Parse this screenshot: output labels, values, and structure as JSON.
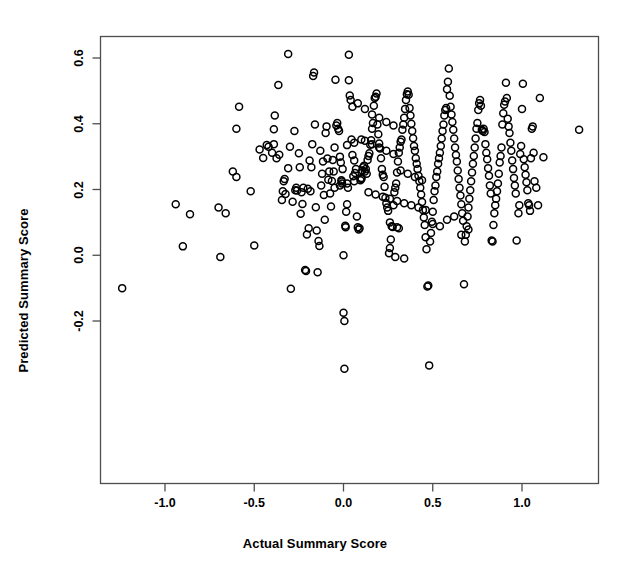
{
  "figure": {
    "type": "scatter-plot",
    "width": 630,
    "height": 581,
    "background_color": "#ffffff",
    "frame_color": "#4d4d4d",
    "point_color": "#000000",
    "point_fill": "none"
  },
  "axes": {
    "x_title": "Actual Summary Score",
    "y_title": "Predicted Summary Score",
    "x_ticks": [
      "-1.0",
      "-0.5",
      "0.0",
      "0.5",
      "1.0"
    ],
    "y_ticks": [
      "-0.2",
      "0.0",
      "0.2",
      "0.4",
      "0.6"
    ]
  },
  "chart_data": {
    "type": "scatter",
    "title": "",
    "xlabel": "Actual Summary Score",
    "ylabel": "Predicted Summary Score",
    "xticks": [
      -1.0,
      -0.5,
      0.0,
      0.5,
      1.0
    ],
    "yticks": [
      -0.2,
      0.0,
      0.2,
      0.4,
      0.6
    ],
    "xlim": [
      -1.37,
      1.44
    ],
    "ylim": [
      -0.375,
      0.675
    ],
    "grid": false,
    "legend": null,
    "marker": "open-circle",
    "marker_size": 7,
    "n_points": 341,
    "points": [
      [
        -1.24,
        -0.1
      ],
      [
        -0.94,
        0.155
      ],
      [
        -0.9,
        0.027
      ],
      [
        -0.86,
        0.125
      ],
      [
        -0.7,
        0.145
      ],
      [
        -0.69,
        -0.005
      ],
      [
        -0.66,
        0.128
      ],
      [
        -0.62,
        0.255
      ],
      [
        -0.6,
        0.238
      ],
      [
        -0.585,
        0.452
      ],
      [
        -0.6,
        0.385
      ],
      [
        -0.52,
        0.195
      ],
      [
        -0.5,
        0.03
      ],
      [
        -0.47,
        0.322
      ],
      [
        -0.45,
        0.296
      ],
      [
        -0.43,
        0.335
      ],
      [
        -0.42,
        0.33
      ],
      [
        -0.4,
        0.312
      ],
      [
        -0.39,
        0.338
      ],
      [
        -0.385,
        0.425
      ],
      [
        -0.39,
        0.383
      ],
      [
        -0.375,
        0.295
      ],
      [
        -0.365,
        0.518
      ],
      [
        -0.36,
        0.306
      ],
      [
        -0.345,
        0.168
      ],
      [
        -0.34,
        0.195
      ],
      [
        -0.335,
        0.225
      ],
      [
        -0.33,
        0.232
      ],
      [
        -0.325,
        0.186
      ],
      [
        -0.31,
        0.612
      ],
      [
        -0.31,
        0.265
      ],
      [
        -0.3,
        0.33
      ],
      [
        -0.295,
        -0.102
      ],
      [
        -0.285,
        0.163
      ],
      [
        -0.275,
        0.378
      ],
      [
        -0.27,
        0.198
      ],
      [
        -0.265,
        0.205
      ],
      [
        -0.26,
        0.197
      ],
      [
        -0.25,
        0.31
      ],
      [
        -0.245,
        0.268
      ],
      [
        -0.24,
        0.126
      ],
      [
        -0.235,
        0.192
      ],
      [
        -0.23,
        0.156
      ],
      [
        -0.225,
        0.205
      ],
      [
        -0.215,
        -0.045
      ],
      [
        -0.21,
        -0.048
      ],
      [
        -0.205,
        0.063
      ],
      [
        -0.2,
        0.202
      ],
      [
        -0.195,
        0.082
      ],
      [
        -0.19,
        0.288
      ],
      [
        -0.185,
        0.195
      ],
      [
        -0.18,
        0.268
      ],
      [
        -0.175,
        0.338
      ],
      [
        -0.17,
        0.545
      ],
      [
        -0.165,
        0.556
      ],
      [
        -0.16,
        0.398
      ],
      [
        -0.155,
        0.146
      ],
      [
        -0.15,
        0.075
      ],
      [
        -0.145,
        -0.052
      ],
      [
        -0.14,
        0.043
      ],
      [
        -0.135,
        0.028
      ],
      [
        -0.13,
        0.318
      ],
      [
        -0.125,
        0.212
      ],
      [
        -0.12,
        0.248
      ],
      [
        -0.115,
        0.285
      ],
      [
        -0.11,
        0.183
      ],
      [
        -0.105,
        0.108
      ],
      [
        -0.1,
        0.372
      ],
      [
        -0.095,
        0.392
      ],
      [
        -0.09,
        0.294
      ],
      [
        -0.085,
        0.23
      ],
      [
        -0.08,
        0.255
      ],
      [
        -0.075,
        0.188
      ],
      [
        -0.07,
        0.148
      ],
      [
        -0.065,
        0.226
      ],
      [
        -0.06,
        0.29
      ],
      [
        -0.055,
        0.255
      ],
      [
        -0.05,
        0.328
      ],
      [
        -0.045,
        0.534
      ],
      [
        -0.04,
        0.395
      ],
      [
        -0.035,
        0.402
      ],
      [
        -0.03,
        0.385
      ],
      [
        -0.025,
        0.378
      ],
      [
        -0.02,
        0.3
      ],
      [
        -0.015,
        0.282
      ],
      [
        -0.012,
        0.228
      ],
      [
        -0.01,
        0.224
      ],
      [
        -0.008,
        0.218
      ],
      [
        -0.005,
        0.262
      ],
      [
        0.0,
        0.0
      ],
      [
        0.0,
        -0.175
      ],
      [
        0.005,
        -0.2
      ],
      [
        0.005,
        -0.345
      ],
      [
        0.01,
        0.09
      ],
      [
        0.012,
        0.085
      ],
      [
        0.015,
        0.132
      ],
      [
        0.02,
        0.155
      ],
      [
        0.025,
        0.205
      ],
      [
        0.03,
        0.61
      ],
      [
        0.03,
        0.532
      ],
      [
        0.035,
        0.486
      ],
      [
        0.04,
        0.472
      ],
      [
        0.045,
        0.352
      ],
      [
        0.05,
        0.305
      ],
      [
        0.055,
        0.24
      ],
      [
        0.06,
        0.288
      ],
      [
        0.065,
        0.25
      ],
      [
        0.07,
        0.262
      ],
      [
        0.075,
        0.118
      ],
      [
        0.08,
        0.085
      ],
      [
        0.085,
        0.078
      ],
      [
        0.09,
        0.082
      ],
      [
        0.095,
        0.228
      ],
      [
        0.1,
        0.235
      ],
      [
        0.105,
        0.258
      ],
      [
        0.11,
        0.268
      ],
      [
        0.115,
        0.272
      ],
      [
        0.12,
        0.255
      ],
      [
        0.125,
        0.262
      ],
      [
        0.13,
        0.248
      ],
      [
        0.135,
        0.29
      ],
      [
        0.14,
        0.302
      ],
      [
        0.145,
        0.31
      ],
      [
        0.15,
        0.336
      ],
      [
        0.155,
        0.35
      ],
      [
        0.16,
        0.385
      ],
      [
        0.165,
        0.402
      ],
      [
        0.17,
        0.455
      ],
      [
        0.175,
        0.478
      ],
      [
        0.18,
        0.482
      ],
      [
        0.185,
        0.492
      ],
      [
        0.19,
        0.398
      ],
      [
        0.195,
        0.368
      ],
      [
        0.2,
        0.34
      ],
      [
        0.205,
        0.325
      ],
      [
        0.21,
        0.295
      ],
      [
        0.215,
        0.262
      ],
      [
        0.22,
        0.245
      ],
      [
        0.225,
        0.238
      ],
      [
        0.23,
        0.208
      ],
      [
        0.235,
        0.175
      ],
      [
        0.24,
        0.158
      ],
      [
        0.245,
        0.145
      ],
      [
        0.25,
        0.135
      ],
      [
        0.255,
        0.006
      ],
      [
        0.26,
        0.022
      ],
      [
        0.265,
        0.048
      ],
      [
        0.27,
        0.088
      ],
      [
        0.275,
        0.086
      ],
      [
        0.28,
        0.152
      ],
      [
        0.285,
        0.192
      ],
      [
        0.29,
        0.205
      ],
      [
        0.295,
        0.218
      ],
      [
        0.3,
        0.252
      ],
      [
        0.305,
        0.285
      ],
      [
        0.31,
        0.312
      ],
      [
        0.315,
        0.328
      ],
      [
        0.32,
        0.345
      ],
      [
        0.325,
        0.352
      ],
      [
        0.33,
        0.382
      ],
      [
        0.335,
        0.398
      ],
      [
        0.34,
        0.418
      ],
      [
        0.345,
        0.445
      ],
      [
        0.35,
        0.472
      ],
      [
        0.355,
        0.49
      ],
      [
        0.36,
        0.498
      ],
      [
        0.365,
        0.488
      ],
      [
        0.37,
        0.448
      ],
      [
        0.375,
        0.425
      ],
      [
        0.38,
        0.4
      ],
      [
        0.385,
        0.378
      ],
      [
        0.39,
        0.356
      ],
      [
        0.395,
        0.332
      ],
      [
        0.4,
        0.318
      ],
      [
        0.405,
        0.295
      ],
      [
        0.41,
        0.278
      ],
      [
        0.415,
        0.262
      ],
      [
        0.42,
        0.242
      ],
      [
        0.425,
        0.225
      ],
      [
        0.43,
        0.205
      ],
      [
        0.435,
        0.185
      ],
      [
        0.44,
        0.162
      ],
      [
        0.445,
        0.138
      ],
      [
        0.45,
        0.115
      ],
      [
        0.455,
        0.092
      ],
      [
        0.46,
        0.055
      ],
      [
        0.465,
        0.018
      ],
      [
        0.47,
        -0.095
      ],
      [
        0.475,
        -0.092
      ],
      [
        0.48,
        -0.335
      ],
      [
        0.485,
        0.042
      ],
      [
        0.49,
        0.068
      ],
      [
        0.495,
        0.102
      ],
      [
        0.5,
        0.132
      ],
      [
        0.505,
        0.168
      ],
      [
        0.51,
        0.195
      ],
      [
        0.515,
        0.212
      ],
      [
        0.52,
        0.238
      ],
      [
        0.525,
        0.255
      ],
      [
        0.53,
        0.278
      ],
      [
        0.535,
        0.295
      ],
      [
        0.54,
        0.312
      ],
      [
        0.545,
        0.332
      ],
      [
        0.55,
        0.355
      ],
      [
        0.555,
        0.378
      ],
      [
        0.56,
        0.398
      ],
      [
        0.565,
        0.425
      ],
      [
        0.57,
        0.442
      ],
      [
        0.575,
        0.448
      ],
      [
        0.58,
        0.505
      ],
      [
        0.585,
        0.528
      ],
      [
        0.59,
        0.568
      ],
      [
        0.595,
        0.485
      ],
      [
        0.6,
        0.452
      ],
      [
        0.605,
        0.428
      ],
      [
        0.61,
        0.405
      ],
      [
        0.615,
        0.382
      ],
      [
        0.62,
        0.355
      ],
      [
        0.625,
        0.328
      ],
      [
        0.63,
        0.305
      ],
      [
        0.635,
        0.285
      ],
      [
        0.64,
        0.258
      ],
      [
        0.645,
        0.232
      ],
      [
        0.65,
        0.205
      ],
      [
        0.655,
        0.182
      ],
      [
        0.66,
        0.155
      ],
      [
        0.665,
        0.128
      ],
      [
        0.67,
        0.105
      ],
      [
        0.675,
        -0.088
      ],
      [
        0.68,
        0.042
      ],
      [
        0.685,
        0.062
      ],
      [
        0.69,
        0.088
      ],
      [
        0.695,
        0.118
      ],
      [
        0.7,
        0.145
      ],
      [
        0.705,
        0.172
      ],
      [
        0.71,
        0.198
      ],
      [
        0.715,
        0.225
      ],
      [
        0.72,
        0.252
      ],
      [
        0.725,
        0.278
      ],
      [
        0.73,
        0.302
      ],
      [
        0.735,
        0.328
      ],
      [
        0.74,
        0.355
      ],
      [
        0.745,
        0.385
      ],
      [
        0.75,
        0.402
      ],
      [
        0.755,
        0.442
      ],
      [
        0.76,
        0.462
      ],
      [
        0.765,
        0.472
      ],
      [
        0.77,
        0.455
      ],
      [
        0.775,
        0.382
      ],
      [
        0.78,
        0.378
      ],
      [
        0.785,
        0.385
      ],
      [
        0.79,
        0.375
      ],
      [
        0.795,
        0.338
      ],
      [
        0.8,
        0.312
      ],
      [
        0.805,
        0.292
      ],
      [
        0.81,
        0.265
      ],
      [
        0.815,
        0.242
      ],
      [
        0.82,
        0.212
      ],
      [
        0.825,
        0.188
      ],
      [
        0.83,
        0.045
      ],
      [
        0.835,
        0.042
      ],
      [
        0.84,
        0.092
      ],
      [
        0.845,
        0.128
      ],
      [
        0.85,
        0.152
      ],
      [
        0.855,
        0.172
      ],
      [
        0.86,
        0.195
      ],
      [
        0.865,
        0.218
      ],
      [
        0.87,
        0.248
      ],
      [
        0.875,
        0.282
      ],
      [
        0.88,
        0.302
      ],
      [
        0.885,
        0.328
      ],
      [
        0.89,
        0.398
      ],
      [
        0.895,
        0.432
      ],
      [
        0.9,
        0.458
      ],
      [
        0.905,
        0.468
      ],
      [
        0.91,
        0.525
      ],
      [
        0.915,
        0.478
      ],
      [
        0.92,
        0.415
      ],
      [
        0.925,
        0.392
      ],
      [
        0.93,
        0.372
      ],
      [
        0.935,
        0.342
      ],
      [
        0.94,
        0.318
      ],
      [
        0.945,
        0.288
      ],
      [
        0.95,
        0.262
      ],
      [
        0.955,
        0.235
      ],
      [
        0.96,
        0.212
      ],
      [
        0.965,
        0.188
      ],
      [
        0.97,
        0.045
      ],
      [
        0.98,
        0.128
      ],
      [
        0.985,
        0.152
      ],
      [
        0.99,
        0.308
      ],
      [
        0.995,
        0.332
      ],
      [
        1.0,
        0.445
      ],
      [
        1.005,
        0.522
      ],
      [
        1.01,
        0.292
      ],
      [
        1.015,
        0.268
      ],
      [
        1.02,
        0.245
      ],
      [
        1.025,
        0.222
      ],
      [
        1.03,
        0.198
      ],
      [
        1.035,
        0.158
      ],
      [
        1.04,
        0.152
      ],
      [
        1.045,
        0.135
      ],
      [
        1.05,
        0.295
      ],
      [
        1.055,
        0.385
      ],
      [
        1.06,
        0.392
      ],
      [
        1.065,
        0.312
      ],
      [
        1.07,
        0.225
      ],
      [
        1.08,
        0.205
      ],
      [
        1.09,
        0.152
      ],
      [
        1.1,
        0.478
      ],
      [
        1.12,
        0.298
      ],
      [
        1.32,
        0.382
      ],
      [
        0.05,
        0.452
      ],
      [
        0.08,
        0.462
      ],
      [
        0.12,
        0.445
      ],
      [
        0.16,
        0.428
      ],
      [
        0.2,
        0.418
      ],
      [
        0.24,
        0.405
      ],
      [
        0.28,
        0.395
      ],
      [
        0.32,
        0.258
      ],
      [
        0.36,
        0.248
      ],
      [
        0.4,
        0.238
      ],
      [
        0.44,
        0.228
      ],
      [
        0.12,
        0.348
      ],
      [
        0.16,
        0.338
      ],
      [
        0.2,
        0.328
      ],
      [
        0.24,
        0.318
      ],
      [
        0.28,
        0.308
      ],
      [
        -0.05,
        0.205
      ],
      [
        -0.02,
        0.212
      ],
      [
        0.02,
        0.218
      ],
      [
        0.06,
        0.225
      ],
      [
        0.1,
        0.232
      ],
      [
        0.14,
        0.192
      ],
      [
        0.18,
        0.185
      ],
      [
        0.22,
        0.178
      ],
      [
        0.26,
        0.172
      ],
      [
        0.3,
        0.165
      ],
      [
        0.34,
        0.158
      ],
      [
        0.38,
        0.152
      ],
      [
        0.42,
        0.145
      ],
      [
        0.46,
        0.138
      ],
      [
        0.5,
        0.095
      ],
      [
        0.54,
        0.088
      ],
      [
        0.58,
        0.108
      ],
      [
        0.62,
        0.118
      ],
      [
        0.66,
        0.062
      ],
      [
        0.7,
        0.078
      ],
      [
        0.02,
        0.335
      ],
      [
        0.06,
        0.342
      ],
      [
        0.1,
        0.352
      ],
      [
        0.3,
        0.085
      ],
      [
        0.31,
        0.082
      ],
      [
        0.34,
        -0.01
      ],
      [
        0.29,
        -0.005
      ],
      [
        0.26,
        0.1
      ]
    ]
  }
}
